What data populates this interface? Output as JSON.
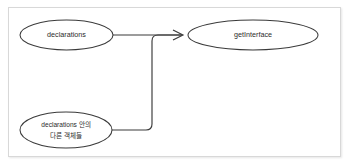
{
  "figure": {
    "background_color": "#ffffff",
    "border_color": "#d8d8d8",
    "stroke_color": "#3a3a3a",
    "text_color": "#2b2b2b"
  },
  "nodes": [
    {
      "id": "declarations",
      "name": "node-declarations",
      "shape": "ellipse",
      "label": "declarations",
      "label_lines": [
        "declarations"
      ],
      "cx": 66.5,
      "cy": 35,
      "rx": 46.5,
      "ry": 15
    },
    {
      "id": "other-objects",
      "name": "node-other-objects",
      "shape": "ellipse",
      "label": "declarations 안의 다른 객체들",
      "label_lines": [
        "declarations 안의",
        "다른 객체들"
      ],
      "cx": 66,
      "cy": 130,
      "rx": 46,
      "ry": 18
    },
    {
      "id": "getinterface",
      "name": "node-getinterface",
      "shape": "ellipse",
      "label": "getInterface",
      "label_lines": [
        "getInterface"
      ],
      "cx": 253,
      "cy": 35,
      "rx": 65,
      "ry": 15
    }
  ],
  "edges": [
    {
      "id": "edge-declarations-to-getinterface",
      "name": "edge-declarations-to-getinterface",
      "from": "declarations",
      "to": "getinterface",
      "style": "straight",
      "arrow": "open-v",
      "path": "M 113 35 L 182 35"
    },
    {
      "id": "edge-other-objects-to-getinterface",
      "name": "edge-other-objects-to-getinterface",
      "from": "other-objects",
      "to": "getinterface",
      "style": "elbow-rounded",
      "arrow": "none",
      "path": "M 112 130 L 146 130 Q 152 130 152 124 L 152 41 Q 152 35 158 35 L 182 35"
    }
  ],
  "arrowheads": [
    {
      "id": "arrowhead-getinterface",
      "name": "arrowhead-getinterface",
      "target": "getinterface",
      "path": "M 173 30 L 183 35 L 173 40"
    }
  ]
}
